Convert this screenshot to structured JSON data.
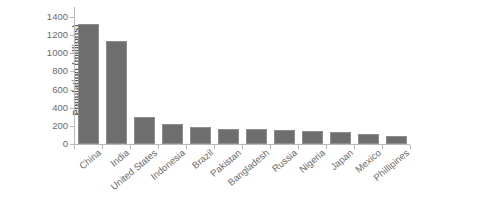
{
  "chart_data": {
    "type": "bar",
    "title": "",
    "subtitle": "",
    "xlabel": "",
    "ylabel": "Population (millions)",
    "ylim": [
      0,
      1400
    ],
    "ytick_step": 200,
    "ytick_labels": [
      "0",
      "200",
      "400",
      "600",
      "800",
      "1000",
      "1200",
      "1400"
    ],
    "grid": false,
    "legend": false,
    "legend_position": "none",
    "bar_color": "#6e6e6e",
    "axis_color": "#b9b9b9",
    "text_color": "#6a6a6a",
    "xtick_label_rotation": -40,
    "categories": [
      "China",
      "India",
      "United States",
      "Indonesia",
      "Brazil",
      "Pakistan",
      "Bangladesh",
      "Russia",
      "Nigeria",
      "Japan",
      "Mexico",
      "Phillipines"
    ],
    "values": [
      1320,
      1140,
      300,
      225,
      190,
      170,
      163,
      150,
      138,
      127,
      112,
      88
    ],
    "series": [
      {
        "name": "Population",
        "values": [
          1320,
          1140,
          300,
          225,
          190,
          170,
          163,
          150,
          138,
          127,
          112,
          88
        ]
      }
    ]
  }
}
